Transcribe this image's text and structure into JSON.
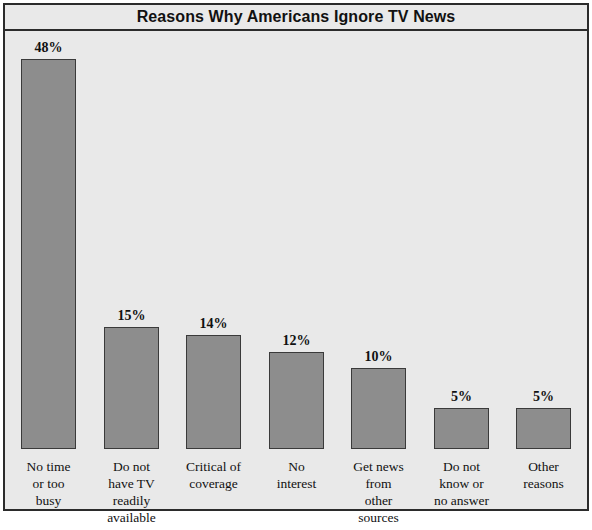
{
  "chart": {
    "title": "Reasons Why Americans Ignore TV News",
    "background_color": "#e9e9e9",
    "bar_fill_color": "#8d8d8d",
    "bar_border_color": "#3a3a3a",
    "frame_color": "#2b2b2b"
  },
  "chart_data": {
    "type": "bar",
    "title": "Reasons Why Americans Ignore TV News",
    "xlabel": "",
    "ylabel": "",
    "ylim": [
      0,
      52
    ],
    "grid": false,
    "legend": null,
    "value_suffix": "%",
    "categories": [
      "No time or too busy",
      "Do not have TV readily available",
      "Critical of coverage",
      "No interest",
      "Get news from other sources",
      "Do not know or no answer",
      "Other reasons"
    ],
    "category_lines": [
      [
        "No time",
        "or too",
        "busy"
      ],
      [
        "Do not",
        "have TV",
        "readily",
        "available"
      ],
      [
        "Critical of",
        "coverage"
      ],
      [
        "No",
        "interest"
      ],
      [
        "Get news",
        "from",
        "other",
        "sources"
      ],
      [
        "Do not",
        "know or",
        "no answer"
      ],
      [
        "Other",
        "reasons"
      ]
    ],
    "values": [
      48,
      15,
      14,
      12,
      10,
      5,
      5
    ],
    "value_labels": [
      "48%",
      "15%",
      "14%",
      "12%",
      "10%",
      "5%",
      "5%"
    ]
  }
}
